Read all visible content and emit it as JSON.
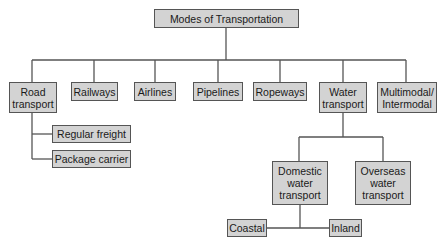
{
  "diagram": {
    "title": "Modes of Transportation",
    "modes": [
      {
        "label": "Road\ntransport"
      },
      {
        "label": "Railways"
      },
      {
        "label": "Airlines"
      },
      {
        "label": "Pipelines"
      },
      {
        "label": "Ropeways"
      },
      {
        "label": "Water\ntransport"
      },
      {
        "label": "Multimodal/\nIntermodal"
      }
    ],
    "road_children": [
      {
        "label": "Regular freight"
      },
      {
        "label": "Package carrier"
      }
    ],
    "water_children": [
      {
        "label": "Domestic\nwater\ntransport"
      },
      {
        "label": "Overseas\nwater\ntransport"
      }
    ],
    "domestic_children": [
      {
        "label": "Coastal"
      },
      {
        "label": "Inland"
      }
    ],
    "colors": {
      "box_fill": "#d3d3d3",
      "border": "#555555",
      "line": "#555555"
    }
  }
}
